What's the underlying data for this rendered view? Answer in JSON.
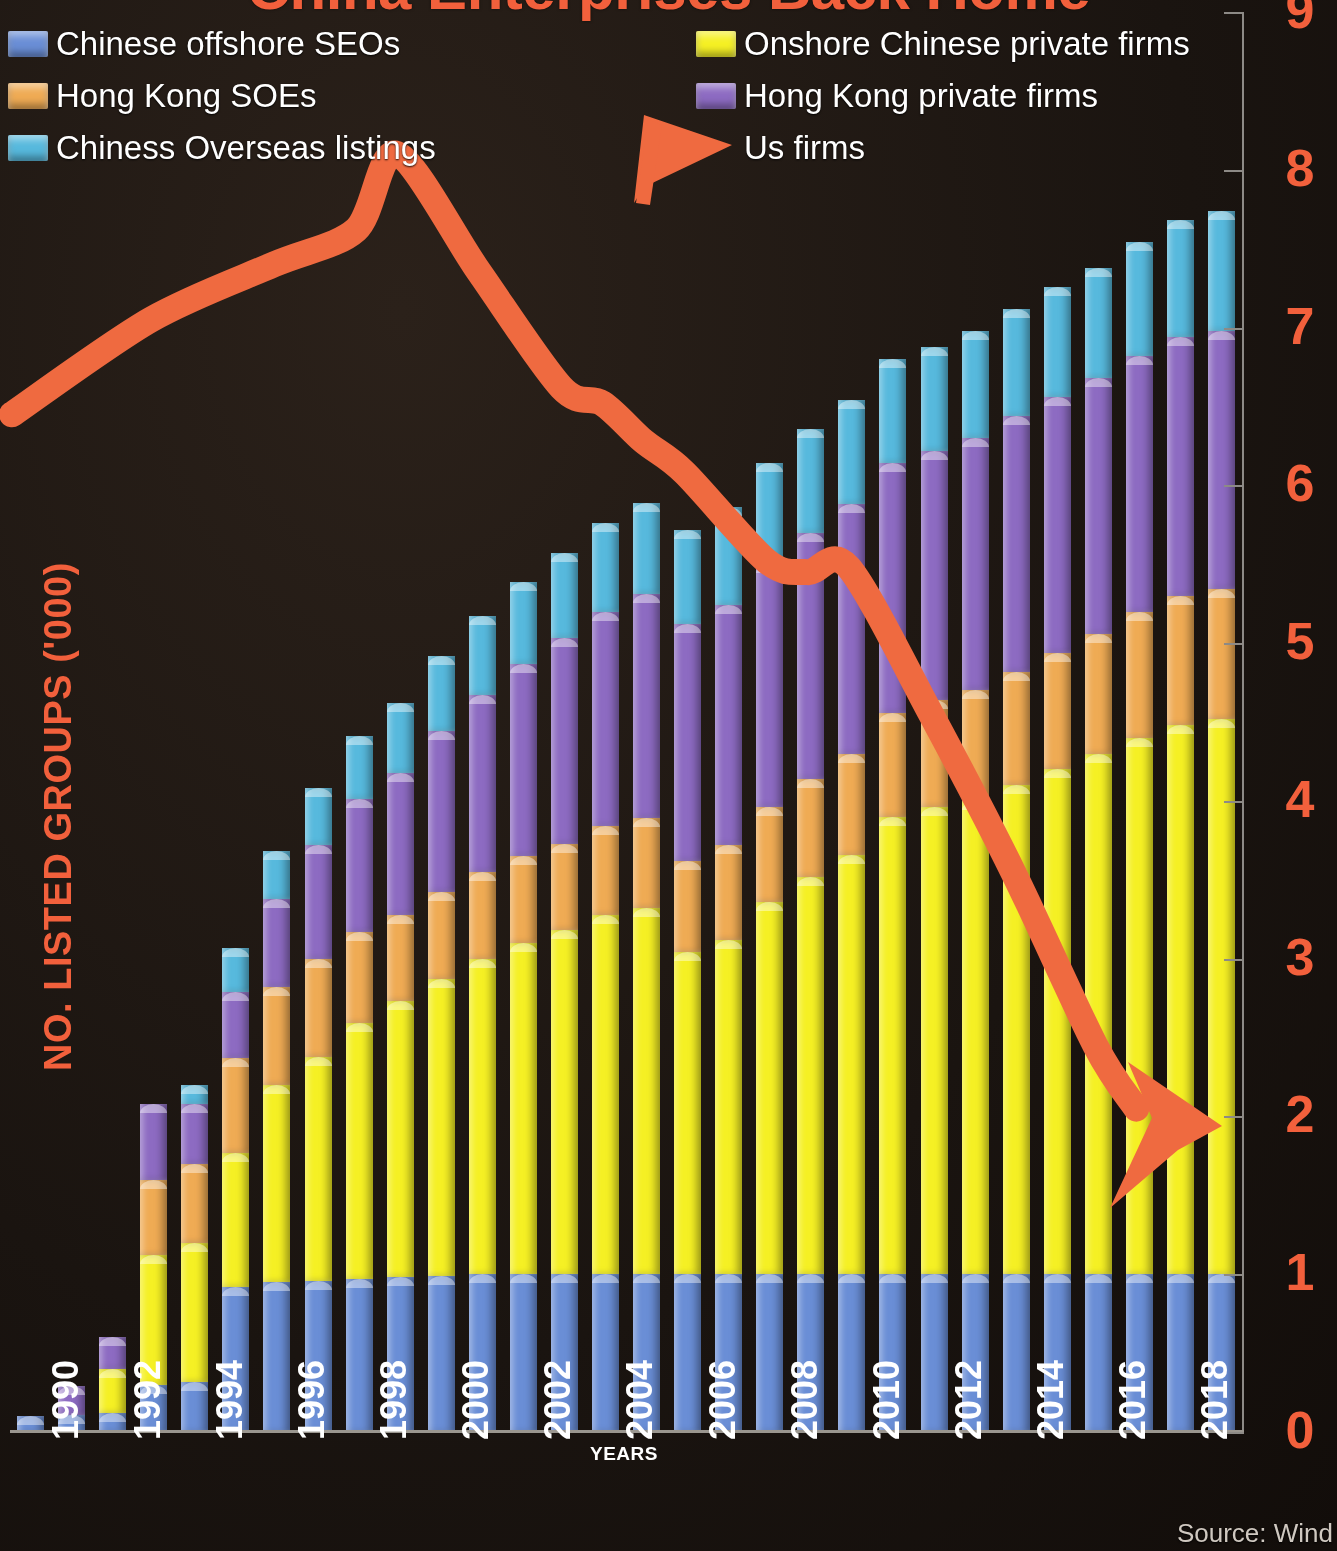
{
  "title": "China Enterprises Back Home",
  "axes": {
    "y_title": "NO. LISTED GROUPS ('000)",
    "x_title": "YEARS",
    "y_ticks": [
      "0",
      "1",
      "2",
      "3",
      "4",
      "5",
      "6",
      "7",
      "8",
      "9"
    ],
    "x_ticks": [
      "1990",
      "1992",
      "1994",
      "1996",
      "1998",
      "2000",
      "2002",
      "2004",
      "2006",
      "2008",
      "2010",
      "2012",
      "2014",
      "2016",
      "2018"
    ]
  },
  "source": "Source: Wind",
  "legend": {
    "left": [
      {
        "label": "Chinese offshore SEOs",
        "color": "#6a8ed6",
        "icon": "square-swatch"
      },
      {
        "label": "Hong Kong SOEs",
        "color": "#efab54",
        "icon": "square-swatch"
      },
      {
        "label": "Chiness Overseas listings",
        "color": "#57b9dd",
        "icon": "square-swatch"
      }
    ],
    "right": [
      {
        "label": "Onshore Chinese private firms",
        "color": "#f5f024",
        "icon": "square-swatch"
      },
      {
        "label": "Hong Kong private firms",
        "color": "#8d6bc2",
        "icon": "square-swatch"
      },
      {
        "label": "Us firms",
        "color": "#ef6a40",
        "icon": "arrow-marker"
      }
    ]
  },
  "colors": {
    "background": "#1a1410",
    "accent": "#f2603c",
    "arrow": "#ef6a40",
    "axis": "#8d8a86",
    "chinese_offshore_seos": "#6a8ed6",
    "hong_kong_soes": "#efab54",
    "chinese_overseas_listings": "#57b9dd",
    "onshore_chinese_private_firms": "#f5f024",
    "hong_kong_private_firms": "#8d6bc2"
  },
  "chart_data": {
    "type": "bar",
    "title": "China Enterprises Back Home",
    "xlabel": "YEARS",
    "ylabel": "NO. LISTED GROUPS ('000)",
    "ylim": [
      0,
      9
    ],
    "grid": false,
    "legend_position": "top",
    "stacked": true,
    "categories": [
      "1990",
      "1991",
      "1992",
      "1993",
      "1994",
      "1995",
      "1996",
      "1997",
      "1998",
      "1999",
      "2000",
      "2001",
      "2002",
      "2003",
      "2004",
      "2005",
      "2006",
      "2007",
      "2008",
      "2009",
      "2010",
      "2011",
      "2012",
      "2013",
      "2014",
      "2015",
      "2016",
      "2017",
      "2018",
      "2019"
    ],
    "series": [
      {
        "name": "Chinese offshore SEOs",
        "color": "#6a8ed6",
        "values": [
          0.1,
          0.11,
          0.12,
          0.3,
          0.32,
          0.92,
          0.95,
          0.96,
          0.97,
          0.98,
          0.99,
          1.0,
          1.0,
          1.0,
          1.0,
          1.0,
          1.0,
          1.0,
          1.0,
          1.0,
          1.0,
          1.0,
          1.0,
          1.0,
          1.0,
          1.0,
          1.0,
          1.0,
          1.0,
          1.0
        ]
      },
      {
        "name": "Onshore Chinese private firms",
        "color": "#f5f024",
        "values": [
          0.0,
          0.0,
          0.28,
          0.82,
          0.88,
          0.85,
          1.25,
          1.42,
          1.62,
          1.75,
          1.88,
          2.0,
          2.1,
          2.18,
          2.28,
          2.32,
          2.04,
          2.12,
          2.36,
          2.52,
          2.66,
          2.9,
          2.96,
          3.0,
          3.1,
          3.2,
          3.3,
          3.4,
          3.48,
          3.52
        ]
      },
      {
        "name": "Hong Kong SOEs",
        "color": "#efab54",
        "values": [
          0.0,
          0.0,
          0.0,
          0.48,
          0.5,
          0.6,
          0.62,
          0.62,
          0.58,
          0.55,
          0.55,
          0.55,
          0.55,
          0.55,
          0.56,
          0.57,
          0.58,
          0.6,
          0.6,
          0.62,
          0.64,
          0.66,
          0.68,
          0.7,
          0.72,
          0.74,
          0.76,
          0.8,
          0.82,
          0.82
        ]
      },
      {
        "name": "Hong Kong private firms",
        "color": "#8d6bc2",
        "values": [
          0.0,
          0.18,
          0.2,
          0.48,
          0.38,
          0.42,
          0.56,
          0.72,
          0.84,
          0.9,
          1.02,
          1.12,
          1.22,
          1.3,
          1.36,
          1.42,
          1.5,
          1.52,
          1.54,
          1.56,
          1.58,
          1.58,
          1.58,
          1.6,
          1.62,
          1.62,
          1.62,
          1.62,
          1.64,
          1.64
        ]
      },
      {
        "name": "Chiness Overseas listings",
        "color": "#57b9dd",
        "values": [
          0.0,
          0.0,
          0.0,
          0.0,
          0.12,
          0.28,
          0.3,
          0.36,
          0.4,
          0.44,
          0.48,
          0.5,
          0.52,
          0.54,
          0.56,
          0.58,
          0.6,
          0.62,
          0.64,
          0.66,
          0.66,
          0.66,
          0.66,
          0.68,
          0.68,
          0.7,
          0.7,
          0.72,
          0.74,
          0.76
        ]
      }
    ],
    "overlay_line": {
      "name": "Us firms",
      "color": "#ef6a40",
      "style": "thick-arrow",
      "points": [
        {
          "x": "1990",
          "y": 6.45
        },
        {
          "x": "1993",
          "y": 7.05
        },
        {
          "x": "1996",
          "y": 7.4
        },
        {
          "x": "1998",
          "y": 7.62
        },
        {
          "x": "1999",
          "y": 8.1
        },
        {
          "x": "2001",
          "y": 7.35
        },
        {
          "x": "2003",
          "y": 6.62
        },
        {
          "x": "2004",
          "y": 6.52
        },
        {
          "x": "2005",
          "y": 6.28
        },
        {
          "x": "2006",
          "y": 6.08
        },
        {
          "x": "2008",
          "y": 5.52
        },
        {
          "x": "2009",
          "y": 5.45
        },
        {
          "x": "2010",
          "y": 5.48
        },
        {
          "x": "2012",
          "y": 4.55
        },
        {
          "x": "2014",
          "y": 3.55
        },
        {
          "x": "2016",
          "y": 2.45
        },
        {
          "x": "2017",
          "y": 2.05
        }
      ]
    }
  }
}
